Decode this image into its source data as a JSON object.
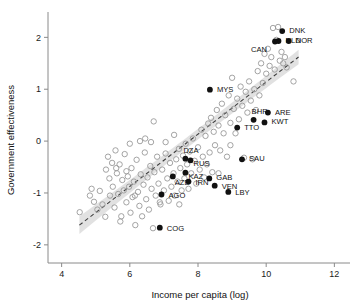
{
  "chart_data": {
    "type": "scatter",
    "title": "",
    "xlabel": "Income per capita (log)",
    "ylabel": "Government effectiveness",
    "xlim": [
      3.6,
      12.4
    ],
    "ylim": [
      -2.35,
      2.45
    ],
    "xticks": [
      4,
      6,
      8,
      10,
      12
    ],
    "yticks": [
      2,
      1,
      0,
      -1,
      -2
    ],
    "xtick_labels": [
      "4",
      "6",
      "8",
      "10",
      "12"
    ],
    "ytick_labels": [
      "2",
      "1",
      "0",
      "-1",
      "-2"
    ],
    "grid": false,
    "legend": "none",
    "trend": {
      "style": "dashed",
      "description": "linear fit with shaded 95% confidence band",
      "x_start": 4.52,
      "x_end": 10.95,
      "y_start": -1.62,
      "y_end": 1.62,
      "band_half_width_start": 0.17,
      "band_half_width_middle": 0.05,
      "band_half_width_end": 0.14
    },
    "labeled_series": {
      "name": "Resource-rich / highlighted countries",
      "marker": "filled circle",
      "points": [
        {
          "label": "DNK",
          "x": 10.47,
          "y": 2.12,
          "lx": 7,
          "ly": 2
        },
        {
          "label": "NOR",
          "x": 10.66,
          "y": 1.93,
          "lx": 7,
          "ly": 2
        },
        {
          "label": "NLD",
          "x": 10.36,
          "y": 1.93,
          "lx": 7,
          "ly": 2
        },
        {
          "label": "CAN",
          "x": 10.26,
          "y": 1.92,
          "lx": -24,
          "ly": 10
        },
        {
          "label": "MYS",
          "x": 8.35,
          "y": 0.99,
          "lx": 7,
          "ly": 2
        },
        {
          "label": "ARE",
          "x": 10.05,
          "y": 0.55,
          "lx": 7,
          "ly": 2
        },
        {
          "label": "BHR",
          "x": 9.63,
          "y": 0.41,
          "lx": -2,
          "ly": -6
        },
        {
          "label": "KWT",
          "x": 9.95,
          "y": 0.36,
          "lx": 7,
          "ly": 2
        },
        {
          "label": "TTO",
          "x": 9.15,
          "y": 0.26,
          "lx": 7,
          "ly": 2
        },
        {
          "label": "DZA",
          "x": 7.63,
          "y": -0.34,
          "lx": -2,
          "ly": -6
        },
        {
          "label": "SAU",
          "x": 9.29,
          "y": -0.35,
          "lx": 7,
          "ly": 2
        },
        {
          "label": "RUS",
          "x": 7.78,
          "y": -0.37,
          "lx": 3,
          "ly": 6
        },
        {
          "label": "KAZ",
          "x": 7.63,
          "y": -0.61,
          "lx": 3,
          "ly": 6
        },
        {
          "label": "GAB",
          "x": 8.33,
          "y": -0.72,
          "lx": 7,
          "ly": 2
        },
        {
          "label": "AZE",
          "x": 7.26,
          "y": -0.68,
          "lx": 2,
          "ly": 9
        },
        {
          "label": "IRN",
          "x": 7.72,
          "y": -0.78,
          "lx": 7,
          "ly": 3
        },
        {
          "label": "VEN",
          "x": 8.49,
          "y": -0.86,
          "lx": 7,
          "ly": 3
        },
        {
          "label": "LBY",
          "x": 8.89,
          "y": -0.98,
          "lx": 7,
          "ly": 3
        },
        {
          "label": "AGO",
          "x": 6.93,
          "y": -1.03,
          "lx": 7,
          "ly": 3
        },
        {
          "label": "COG",
          "x": 6.88,
          "y": -1.67,
          "lx": 7,
          "ly": 3
        }
      ]
    },
    "background_series": {
      "name": "Other countries",
      "marker": "open circle",
      "points": [
        [
          4.53,
          -1.37
        ],
        [
          4.83,
          -1.05
        ],
        [
          4.88,
          -0.92
        ],
        [
          4.95,
          -1.17
        ],
        [
          5.05,
          -1.32
        ],
        [
          5.12,
          -0.96
        ],
        [
          5.2,
          -1.22
        ],
        [
          5.28,
          -1.46
        ],
        [
          5.3,
          -0.55
        ],
        [
          5.36,
          -0.3
        ],
        [
          5.4,
          -0.72
        ],
        [
          5.42,
          -1.05
        ],
        [
          5.48,
          -0.42
        ],
        [
          5.5,
          -0.88
        ],
        [
          5.55,
          -1.28
        ],
        [
          5.58,
          -0.18
        ],
        [
          5.62,
          -0.62
        ],
        [
          5.66,
          -1.02
        ],
        [
          5.7,
          -0.45
        ],
        [
          5.72,
          -1.55
        ],
        [
          5.78,
          -0.75
        ],
        [
          5.82,
          -0.95
        ],
        [
          5.85,
          -0.25
        ],
        [
          5.9,
          -1.18
        ],
        [
          5.94,
          -0.68
        ],
        [
          5.98,
          -0.88
        ],
        [
          6.02,
          -1.38
        ],
        [
          6.05,
          -0.52
        ],
        [
          6.08,
          -1.08
        ],
        [
          6.12,
          -0.78
        ],
        [
          6.16,
          -1.62
        ],
        [
          6.2,
          -0.36
        ],
        [
          6.24,
          -0.98
        ],
        [
          6.28,
          -1.25
        ],
        [
          6.32,
          -0.64
        ],
        [
          6.36,
          -1.45
        ],
        [
          6.4,
          -0.84
        ],
        [
          6.44,
          -0.22
        ],
        [
          6.48,
          -1.12
        ],
        [
          6.52,
          -0.7
        ],
        [
          6.56,
          -1.32
        ],
        [
          6.6,
          -0.48
        ],
        [
          6.64,
          -0.92
        ],
        [
          6.68,
          -1.68
        ],
        [
          6.72,
          -0.6
        ],
        [
          6.76,
          -1.05
        ],
        [
          6.8,
          -0.3
        ],
        [
          6.84,
          -0.82
        ],
        [
          6.9,
          -1.22
        ],
        [
          6.95,
          -0.55
        ],
        [
          7.0,
          -0.95
        ],
        [
          7.05,
          -0.24
        ],
        [
          7.1,
          -0.72
        ],
        [
          7.14,
          -1.15
        ],
        [
          7.18,
          -0.42
        ],
        [
          7.22,
          -0.88
        ],
        [
          7.28,
          -0.62
        ],
        [
          7.32,
          -1.05
        ],
        [
          7.36,
          -0.35
        ],
        [
          7.4,
          -0.78
        ],
        [
          7.44,
          -0.15
        ],
        [
          7.48,
          -0.52
        ],
        [
          7.52,
          -0.95
        ],
        [
          7.56,
          -0.28
        ],
        [
          7.6,
          -0.72
        ],
        [
          7.64,
          -0.05
        ],
        [
          7.68,
          -0.45
        ],
        [
          7.72,
          -0.92
        ],
        [
          7.76,
          -0.2
        ],
        [
          7.8,
          -0.62
        ],
        [
          7.85,
          0.05
        ],
        [
          7.9,
          -0.38
        ],
        [
          7.95,
          -0.82
        ],
        [
          8.0,
          -0.12
        ],
        [
          8.05,
          -0.55
        ],
        [
          8.1,
          0.22
        ],
        [
          8.14,
          -0.3
        ],
        [
          8.18,
          -0.7
        ],
        [
          8.22,
          0.1
        ],
        [
          8.26,
          -0.45
        ],
        [
          8.3,
          0.34
        ],
        [
          8.34,
          -0.22
        ],
        [
          8.38,
          0.45
        ],
        [
          8.42,
          -0.6
        ],
        [
          8.46,
          0.18
        ],
        [
          8.5,
          -0.08
        ],
        [
          8.55,
          0.6
        ],
        [
          8.6,
          0.3
        ],
        [
          8.65,
          -0.18
        ],
        [
          8.7,
          0.72
        ],
        [
          8.75,
          0.15
        ],
        [
          8.8,
          0.5
        ],
        [
          8.85,
          -0.3
        ],
        [
          8.9,
          0.88
        ],
        [
          8.95,
          0.35
        ],
        [
          9.0,
          1.22
        ],
        [
          9.05,
          0.62
        ],
        [
          9.1,
          0.15
        ],
        [
          9.15,
          0.82
        ],
        [
          9.2,
          0.42
        ],
        [
          9.25,
          1.05
        ],
        [
          9.3,
          0.68
        ],
        [
          9.35,
          -0.32
        ],
        [
          9.4,
          0.95
        ],
        [
          9.45,
          0.55
        ],
        [
          9.5,
          1.15
        ],
        [
          9.55,
          0.78
        ],
        [
          9.6,
          -0.35
        ],
        [
          9.65,
          1.0
        ],
        [
          9.7,
          0.6
        ],
        [
          9.75,
          1.35
        ],
        [
          9.8,
          0.88
        ],
        [
          9.85,
          1.5
        ],
        [
          9.9,
          1.12
        ],
        [
          9.95,
          1.68
        ],
        [
          10.0,
          1.3
        ],
        [
          10.05,
          1.78
        ],
        [
          10.1,
          1.45
        ],
        [
          10.15,
          1.62
        ],
        [
          10.2,
          2.18
        ],
        [
          10.25,
          1.38
        ],
        [
          10.3,
          1.95
        ],
        [
          10.35,
          2.2
        ],
        [
          10.4,
          1.55
        ],
        [
          10.45,
          1.72
        ],
        [
          10.5,
          1.5
        ],
        [
          10.55,
          1.62
        ],
        [
          10.6,
          1.42
        ],
        [
          10.8,
          1.15
        ],
        [
          6.0,
          -0.05
        ],
        [
          6.3,
          0.0
        ],
        [
          6.62,
          -0.02
        ],
        [
          7.05,
          -0.02
        ],
        [
          6.45,
          0.05
        ],
        [
          5.75,
          -1.45
        ],
        [
          6.7,
          0.38
        ],
        [
          7.3,
          0.12
        ],
        [
          8.6,
          -0.62
        ],
        [
          8.95,
          -0.08
        ],
        [
          7.45,
          -1.22
        ],
        [
          6.15,
          -1.05
        ],
        [
          5.6,
          -0.52
        ],
        [
          5.9,
          -0.58
        ],
        [
          6.88,
          -1.18
        ]
      ]
    }
  }
}
